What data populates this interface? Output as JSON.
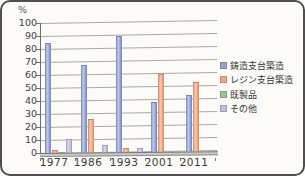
{
  "chart": {
    "y_unit": "%"
  },
  "chart_data": {
    "type": "bar",
    "style": "3d-column",
    "title": "",
    "xlabel": "",
    "ylabel": "%",
    "ylim": [
      0,
      100
    ],
    "yticks": [
      100,
      90,
      80,
      70,
      60,
      50,
      40,
      30,
      20,
      10,
      0
    ],
    "grid": true,
    "legend_position": "right",
    "categories": [
      "1977",
      "1986",
      "1993",
      "2001",
      "2011"
    ],
    "series": [
      {
        "key": "cast",
        "name": "鋳造支台築造",
        "color": "#93a3cd",
        "color_light": "#c2cce8",
        "color_dark": "#7385b5",
        "values": [
          85,
          68,
          90,
          39,
          45
        ]
      },
      {
        "key": "resin",
        "name": "レジン支台築造",
        "color": "#f0a887",
        "color_light": "#f9cbb1",
        "color_dark": "#cf8465",
        "values": [
          2,
          26,
          4,
          61,
          55
        ]
      },
      {
        "key": "premade",
        "name": "既製品",
        "color": "#9fc09b",
        "color_light": "#c8dec2",
        "color_dark": "#7da379",
        "values": [
          1,
          1,
          1,
          0.5,
          0.5
        ]
      },
      {
        "key": "other",
        "name": "その他",
        "color": "#c6bcdb",
        "color_light": "#e0daec",
        "color_dark": "#a297bd",
        "values": [
          11,
          6,
          4,
          1,
          1
        ]
      }
    ]
  }
}
